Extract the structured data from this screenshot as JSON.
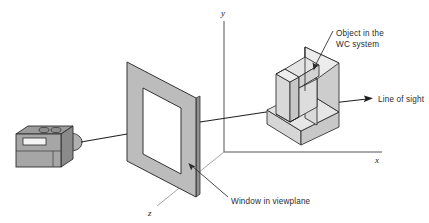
{
  "figure": {
    "background_color": "#ffffff"
  },
  "axes": {
    "origin": {
      "x": 224,
      "y": 152
    },
    "y_axis": {
      "label": "y",
      "label_x": 222,
      "label_y": 16,
      "tip_x": 224,
      "tip_y": 20
    },
    "x_axis": {
      "label": "x",
      "label_x": 376,
      "label_y": 162,
      "tip_x": 382,
      "tip_y": 152
    },
    "z_axis": {
      "label": "z",
      "label_x": 149,
      "label_y": 215,
      "tip_x": 157,
      "tip_y": 205
    },
    "color": "#4a4a4a"
  },
  "camera": {
    "name": "camera",
    "body_fill": "#a8a8a8",
    "top_fill": "#9a9a9a",
    "side_fill": "#8c8c8c",
    "lens_fill": "#b4b4b4",
    "viewfinder_fill": "#f2f2f2",
    "outline": "#2d2d2d"
  },
  "viewplane": {
    "name": "viewplane-frame",
    "frame_fill": "#b9b9b9",
    "aperture_fill": "#ffffff",
    "outline": "#333333",
    "edge_fill": "#8f8f8f"
  },
  "object": {
    "name": "wc-object",
    "top_fill": "#e8e8e8",
    "front_fill": "#dcdcdc",
    "side_fill": "#cfcfcf",
    "inner_fill": "#e3e3e3",
    "outline": "#2a2a2a"
  },
  "labels": {
    "object_line1": "Object in the",
    "object_line2": "WC system",
    "object_x": 336,
    "object_y1": 36,
    "object_y2": 47,
    "line_of_sight": "Line of sight",
    "line_of_sight_x": 378,
    "line_of_sight_y": 101,
    "window": "Window in viewplane",
    "window_x": 231,
    "window_y": 201
  },
  "sight_ray": {
    "name": "line-of-sight-ray",
    "color": "#1f1f1f",
    "from_x": 80,
    "from_y": 144,
    "to_x": 374,
    "to_y": 98
  },
  "leaders": {
    "object_leader": {
      "from_x": 333,
      "from_y": 42,
      "to_x": 316,
      "to_y": 71
    },
    "window_leader": {
      "from_x": 228,
      "from_y": 197,
      "to_x": 196,
      "to_y": 166
    }
  },
  "colors": {
    "ink": "#2b2b2b",
    "line": "#333333",
    "accent_gray": "#b9b9b9"
  }
}
